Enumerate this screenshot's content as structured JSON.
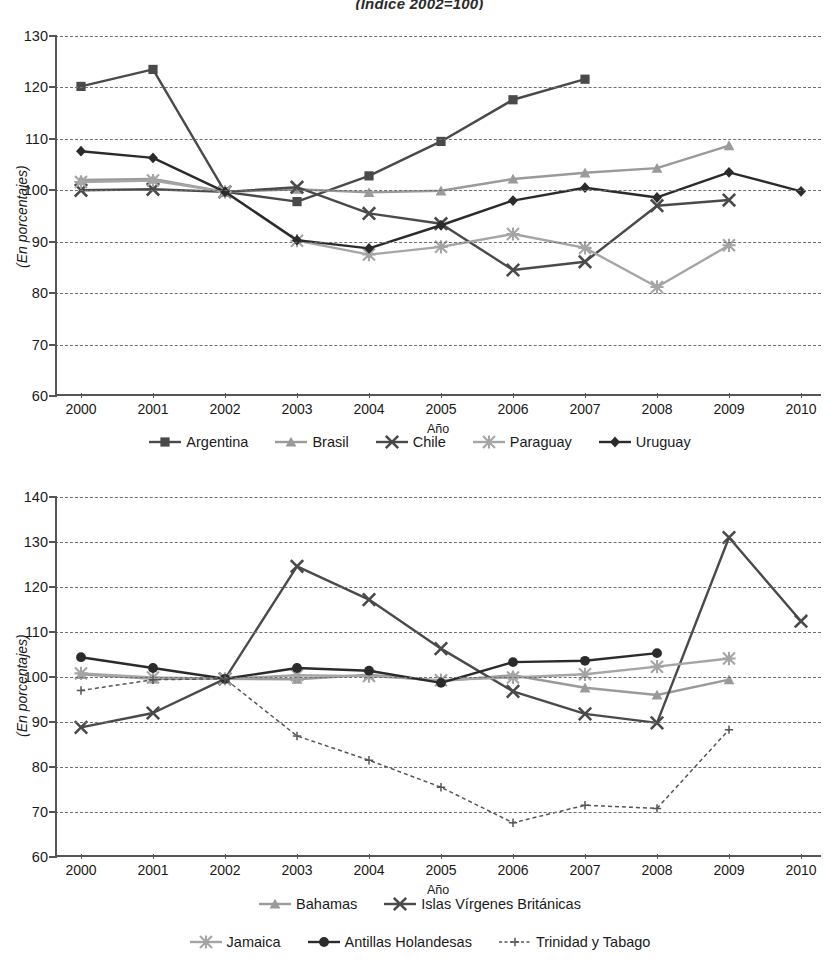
{
  "title": "(Índice 2002=100)",
  "axis": {
    "xlabel": "Año",
    "ylabel": "(En porcentajes)",
    "years": [
      "2000",
      "2001",
      "2002",
      "2003",
      "2004",
      "2005",
      "2006",
      "2007",
      "2008",
      "2009",
      "2010"
    ]
  },
  "chart_data": [
    {
      "type": "line",
      "title": "(Índice 2002=100)",
      "xlabel": "Año",
      "ylabel": "(En porcentajes)",
      "ylim": [
        60,
        130
      ],
      "ytick_step": 10,
      "yticks": [
        60,
        70,
        80,
        90,
        100,
        110,
        120,
        130
      ],
      "grid": true,
      "legend_position": "bottom",
      "x": [
        "2000",
        "2001",
        "2002",
        "2003",
        "2004",
        "2005",
        "2006",
        "2007",
        "2008",
        "2009",
        "2010"
      ],
      "series": [
        {
          "name": "Argentina",
          "marker": "square",
          "color": "#4a4a4a",
          "values": [
            120.2,
            123.5,
            99.7,
            97.8,
            102.8,
            109.5,
            117.6,
            121.6,
            null,
            null,
            null
          ]
        },
        {
          "name": "Brasil",
          "marker": "triangle",
          "color": "#9a9a9a",
          "values": [
            102.0,
            102.2,
            99.7,
            100.2,
            99.6,
            99.9,
            102.2,
            103.4,
            104.3,
            108.7,
            null
          ]
        },
        {
          "name": "Chile",
          "marker": "x",
          "color": "#4a4a4a",
          "values": [
            100.0,
            100.2,
            99.7,
            100.6,
            95.5,
            93.5,
            84.5,
            86.1,
            97.0,
            98.1,
            null
          ]
        },
        {
          "name": "Paraguay",
          "marker": "asterisk",
          "color": "#a5a5a5",
          "values": [
            101.6,
            101.9,
            99.7,
            90.2,
            87.5,
            89.0,
            91.5,
            88.8,
            81.2,
            89.3,
            null
          ]
        },
        {
          "name": "Uruguay",
          "marker": "diamond",
          "color": "#2b2b2b",
          "values": [
            107.6,
            106.3,
            99.7,
            90.3,
            88.7,
            93.2,
            98.0,
            100.5,
            98.6,
            103.5,
            99.8
          ]
        }
      ]
    },
    {
      "type": "line",
      "xlabel": "Año",
      "ylabel": "(En porcentajes)",
      "ylim": [
        60,
        140
      ],
      "ytick_step": 10,
      "yticks": [
        60,
        70,
        80,
        90,
        100,
        110,
        120,
        130,
        140
      ],
      "grid": true,
      "legend_position": "bottom",
      "x": [
        "2000",
        "2001",
        "2002",
        "2003",
        "2004",
        "2005",
        "2006",
        "2007",
        "2008",
        "2009",
        "2010"
      ],
      "series": [
        {
          "name": "Bahamas",
          "marker": "triangle",
          "color": "#9a9a9a",
          "values": [
            100.6,
            99.6,
            99.6,
            99.5,
            100.5,
            99.1,
            100.4,
            97.6,
            96.0,
            99.4,
            null
          ]
        },
        {
          "name": "Islas Vírgenes Británicas",
          "marker": "x",
          "color": "#4a4a4a",
          "values": [
            88.8,
            92.0,
            99.6,
            124.6,
            117.2,
            106.3,
            96.8,
            91.8,
            89.8,
            131.0,
            112.4
          ]
        },
        {
          "name": "Jamaica",
          "marker": "asterisk",
          "color": "#a5a5a5",
          "values": [
            100.8,
            99.9,
            99.6,
            100.4,
            100.2,
            99.3,
            99.9,
            100.6,
            102.3,
            104.1,
            null
          ]
        },
        {
          "name": "Antillas Holandesas",
          "marker": "circle",
          "color": "#2b2b2b",
          "values": [
            104.4,
            102.0,
            99.6,
            102.0,
            101.4,
            98.7,
            103.3,
            103.6,
            105.3,
            null,
            null
          ]
        },
        {
          "name": "Trinidad y Tabago",
          "marker": "plus",
          "color": "#555555",
          "dashed": true,
          "values": [
            97.0,
            99.4,
            99.6,
            86.9,
            81.5,
            75.5,
            67.6,
            71.5,
            70.8,
            88.3,
            null
          ]
        }
      ]
    }
  ],
  "legends": [
    {
      "rows": [
        [
          "Argentina",
          "Brasil",
          "Chile",
          "Paraguay",
          "Uruguay"
        ]
      ]
    },
    {
      "rows": [
        [
          "Bahamas",
          "Islas Vírgenes Británicas"
        ],
        [
          "Jamaica",
          "Antillas Holandesas",
          "Trinidad y Tabago"
        ]
      ]
    }
  ]
}
